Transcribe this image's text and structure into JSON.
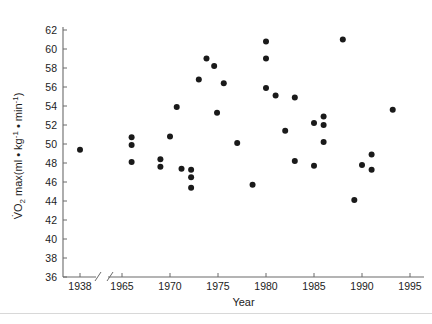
{
  "chart_data": {
    "type": "scatter",
    "title": "",
    "xlabel": "Year",
    "ylabel": "VO2 max(ml • kg-1 • min-1)",
    "ylabel_parts": {
      "v_dot": "V",
      "o": "O",
      "two": "2",
      "max_open": "max(ml • kg",
      "sup1": "-1",
      "mid": "• min",
      "sup2": "-1",
      "close": ")"
    },
    "xlim": [
      1937,
      1996
    ],
    "ylim": [
      36,
      62
    ],
    "xticks": [
      1938,
      1965,
      1970,
      1975,
      1980,
      1985,
      1990,
      1995
    ],
    "xtick_labels": [
      "1938",
      "1965",
      "1970",
      "1975",
      "1980",
      "1985",
      "1990",
      "1995"
    ],
    "yticks": [
      36,
      38,
      40,
      42,
      44,
      46,
      48,
      50,
      52,
      54,
      56,
      58,
      60,
      62
    ],
    "ytick_labels": [
      "36",
      "38",
      "40",
      "42",
      "44",
      "46",
      "48",
      "50",
      "52",
      "54",
      "56",
      "58",
      "60",
      "62"
    ],
    "axis_break": {
      "present": true,
      "between": [
        1938,
        1965
      ],
      "symbol": "//"
    },
    "grid": false,
    "legend": null,
    "marker": {
      "shape": "circle",
      "color": "#1a1a1a",
      "size": 3.0
    },
    "points": [
      {
        "x": 1938.0,
        "y": 49.4
      },
      {
        "x": 1966.0,
        "y": 50.7
      },
      {
        "x": 1966.0,
        "y": 49.9
      },
      {
        "x": 1966.0,
        "y": 48.1
      },
      {
        "x": 1969.0,
        "y": 48.4
      },
      {
        "x": 1969.0,
        "y": 47.6
      },
      {
        "x": 1970.0,
        "y": 50.8
      },
      {
        "x": 1970.7,
        "y": 53.9
      },
      {
        "x": 1971.2,
        "y": 47.4
      },
      {
        "x": 1972.2,
        "y": 47.3
      },
      {
        "x": 1972.2,
        "y": 46.5
      },
      {
        "x": 1972.2,
        "y": 45.4
      },
      {
        "x": 1973.0,
        "y": 56.8
      },
      {
        "x": 1973.8,
        "y": 59.0
      },
      {
        "x": 1974.6,
        "y": 58.2
      },
      {
        "x": 1974.9,
        "y": 53.3
      },
      {
        "x": 1975.6,
        "y": 56.4
      },
      {
        "x": 1977.0,
        "y": 50.1
      },
      {
        "x": 1978.6,
        "y": 45.7
      },
      {
        "x": 1980.0,
        "y": 60.8
      },
      {
        "x": 1980.0,
        "y": 59.0
      },
      {
        "x": 1980.0,
        "y": 55.9
      },
      {
        "x": 1981.0,
        "y": 55.1
      },
      {
        "x": 1982.0,
        "y": 51.4
      },
      {
        "x": 1983.0,
        "y": 54.9
      },
      {
        "x": 1983.0,
        "y": 48.2
      },
      {
        "x": 1985.0,
        "y": 52.2
      },
      {
        "x": 1985.0,
        "y": 47.7
      },
      {
        "x": 1986.0,
        "y": 52.9
      },
      {
        "x": 1986.0,
        "y": 52.0
      },
      {
        "x": 1986.0,
        "y": 50.2
      },
      {
        "x": 1988.0,
        "y": 61.0
      },
      {
        "x": 1989.2,
        "y": 44.1
      },
      {
        "x": 1990.0,
        "y": 47.8
      },
      {
        "x": 1991.0,
        "y": 48.9
      },
      {
        "x": 1991.0,
        "y": 47.3
      },
      {
        "x": 1993.2,
        "y": 53.6
      }
    ]
  }
}
